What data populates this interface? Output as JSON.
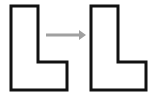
{
  "figure": {
    "type": "diagram",
    "canvas": {
      "width": 154,
      "height": 98,
      "background": "#ffffff"
    },
    "style": {
      "shape_stroke_color": "#111111",
      "shape_fill_color": "#ffffff",
      "shape_stroke_width": 3,
      "arrow_color": "#a0a0a0",
      "arrow_stroke_width": 3
    },
    "shapes": [
      {
        "name": "left-l-shape",
        "label": "L",
        "points": "11,6 38,6 38,62 67,62 67,90 11,90",
        "bbox": {
          "x": 11,
          "y": 6,
          "width": 56,
          "height": 84
        },
        "stem_width": 27,
        "foot_height": 28
      },
      {
        "name": "right-l-shape",
        "label": "L",
        "points": "91,6 118,6 118,62 146,62 146,90 91,90",
        "bbox": {
          "x": 91,
          "y": 6,
          "width": 55,
          "height": 84
        },
        "stem_width": 27,
        "foot_height": 28
      }
    ],
    "arrow": {
      "name": "transform-arrow",
      "direction": "right",
      "x1": 46,
      "y1": 35,
      "x2": 79,
      "y2": 35,
      "head_points": "79,30 86,35 79,40",
      "color": "#a0a0a0"
    }
  }
}
